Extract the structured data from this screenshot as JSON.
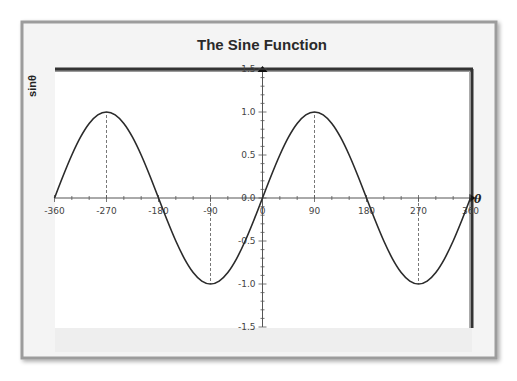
{
  "chart_data": {
    "type": "line",
    "title": "The Sine Function",
    "xlabel": "θ",
    "ylabel": "sinθ",
    "xlim": [
      -360,
      360
    ],
    "ylim": [
      -1.5,
      1.5
    ],
    "x_ticks": [
      -360,
      -270,
      -180,
      -90,
      0,
      90,
      180,
      270,
      360
    ],
    "x_tick_labels": [
      "-360",
      "-270",
      "-180",
      "-90",
      "0",
      "90",
      "180",
      "270",
      "360"
    ],
    "x_minor_step": 30,
    "y_ticks": [
      1.5,
      1.0,
      0.5,
      0.0,
      -0.5,
      -1.0,
      -1.5
    ],
    "y_tick_labels": [
      "1.5",
      "1.0",
      "0.5",
      "0.0",
      "-0.5",
      "-1.0",
      "-1.5"
    ],
    "y_minor_step": 0.1,
    "grid": false,
    "legend": null,
    "series": [
      {
        "name": "sinθ",
        "color": "#2b2b2b",
        "x": [
          -360,
          -345,
          -330,
          -315,
          -300,
          -285,
          -270,
          -255,
          -240,
          -225,
          -210,
          -195,
          -180,
          -165,
          -150,
          -135,
          -120,
          -105,
          -90,
          -75,
          -60,
          -45,
          -30,
          -15,
          0,
          15,
          30,
          45,
          60,
          75,
          90,
          105,
          120,
          135,
          150,
          165,
          180,
          195,
          210,
          225,
          240,
          255,
          270,
          285,
          300,
          315,
          330,
          345,
          360
        ],
        "y": [
          0,
          0.259,
          0.5,
          0.707,
          0.866,
          0.966,
          1,
          0.966,
          0.866,
          0.707,
          0.5,
          0.259,
          0,
          -0.259,
          -0.5,
          -0.707,
          -0.866,
          -0.966,
          -1,
          -0.966,
          -0.866,
          -0.707,
          -0.5,
          -0.259,
          0,
          0.259,
          0.5,
          0.707,
          0.866,
          0.966,
          1,
          0.966,
          0.866,
          0.707,
          0.5,
          0.259,
          0,
          -0.259,
          -0.5,
          -0.707,
          -0.866,
          -0.966,
          -1,
          -0.966,
          -0.866,
          -0.707,
          -0.5,
          -0.259,
          0
        ]
      }
    ],
    "annotations": [
      {
        "type": "dashed-guide",
        "x": -270,
        "from_y": 0,
        "to_y": 1
      },
      {
        "type": "dashed-guide",
        "x": -90,
        "from_y": 0,
        "to_y": -1
      },
      {
        "type": "dashed-guide",
        "x": 90,
        "from_y": 0,
        "to_y": 1
      },
      {
        "type": "dashed-guide",
        "x": 270,
        "from_y": 0,
        "to_y": -1
      }
    ]
  },
  "colors": {
    "card_bg": "#f4f4f4",
    "card_border": "#9c9c9c",
    "plot_bg": "#ffffff",
    "frame": "#333333",
    "axis": "#555555",
    "curve": "#2b2b2b"
  }
}
